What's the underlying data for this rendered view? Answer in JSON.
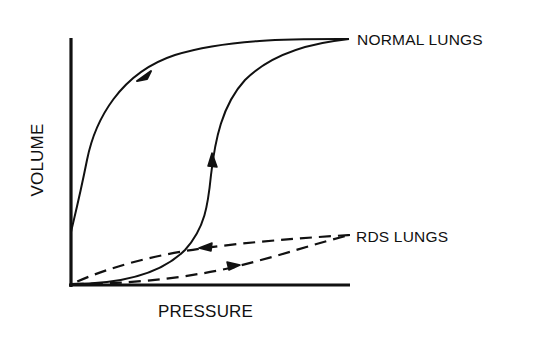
{
  "figure": {
    "x_axis_label": "PRESSURE",
    "y_axis_label": "VOLUME",
    "series": [
      {
        "name": "NORMAL LUNGS",
        "line_style": "solid",
        "description": "Wide hysteresis loop; inflation limb rises sigmoidally, deflation limb stays high and returns to volume axis above origin",
        "arrows": [
          "deflation limb: toward lower pressure",
          "inflation limb: toward higher volume"
        ]
      },
      {
        "name": "RDS LUNGS",
        "line_style": "dashed",
        "description": "Flat, narrow loop with low volume across pressures",
        "arrows": [
          "upper limb: toward lower pressure",
          "lower limb: toward higher pressure"
        ]
      }
    ],
    "colors": {
      "ink": "#111111",
      "background": "#ffffff"
    }
  }
}
